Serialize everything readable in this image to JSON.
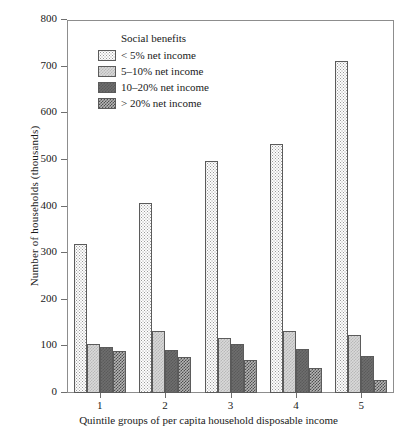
{
  "chart_data": {
    "type": "bar",
    "title": "",
    "xlabel": "Quintile groups of per capita household disposable income",
    "ylabel": "Number of households (thousands)",
    "categories": [
      "1",
      "2",
      "3",
      "4",
      "5"
    ],
    "ylim": [
      0,
      800
    ],
    "yticks": [
      0,
      100,
      200,
      300,
      400,
      500,
      600,
      700,
      800
    ],
    "ytick_labels": [
      "0",
      "100",
      "200",
      "300",
      "400",
      "500",
      "600",
      "700",
      "800"
    ],
    "grid": false,
    "legend_position": "upper-left-inside",
    "legend_title": "Social benefits",
    "series": [
      {
        "name": "< 5% net income",
        "values": [
          320,
          408,
          497,
          533,
          713
        ],
        "color": "#fdfdfd",
        "pattern": "fine-dots"
      },
      {
        "name": "5–10% net income",
        "values": [
          105,
          132,
          117,
          132,
          124
        ],
        "color": "#d9d9d9",
        "pattern": "light-check"
      },
      {
        "name": "10–20% net income",
        "values": [
          99,
          92,
          105,
          95,
          79
        ],
        "color": "#6e6e6e",
        "pattern": "solid-dark"
      },
      {
        "name": "> 20% net income",
        "values": [
          90,
          77,
          71,
          54,
          28
        ],
        "color": "#b5b5b5",
        "pattern": "dark-check"
      }
    ]
  },
  "axes": {
    "frame_color": "#8d8d8d",
    "tick_color": "#6f6f6f",
    "bar_edge_color": "#5b5b5b"
  }
}
